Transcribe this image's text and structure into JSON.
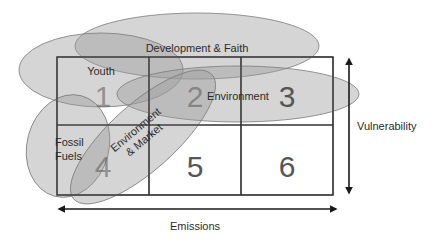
{
  "diagram": {
    "grid": {
      "cells": [
        {
          "id": 1,
          "label": "1"
        },
        {
          "id": 2,
          "label": "2"
        },
        {
          "id": 3,
          "label": "3"
        },
        {
          "id": 4,
          "label": "4"
        },
        {
          "id": 5,
          "label": "5"
        },
        {
          "id": 6,
          "label": "6"
        }
      ]
    },
    "groups": [
      {
        "name": "Development & Faith"
      },
      {
        "name": "Youth"
      },
      {
        "name": "Environment"
      },
      {
        "name": "Fossil Fuels",
        "lines": [
          "Fossil",
          "Fuels"
        ]
      },
      {
        "name": "Environment & Market",
        "lines": [
          "Environment",
          "& Market"
        ]
      }
    ],
    "axes": {
      "horizontal": {
        "label": "Emissions",
        "direction": "bidirectional"
      },
      "vertical": {
        "label": "Vulnerability",
        "direction": "bidirectional"
      }
    },
    "colors": {
      "ellipse_fill": "#9a9a9a",
      "ellipse_stroke": "#808080",
      "grid_line": "#333333",
      "arrow": "#1a1a1a"
    }
  }
}
